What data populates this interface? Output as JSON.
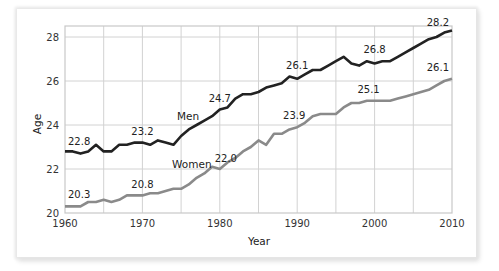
{
  "chart_data": {
    "type": "line",
    "title": "",
    "xlabel": "Year",
    "ylabel": "Age",
    "xlim": [
      1960,
      2010
    ],
    "ylim": [
      20,
      28.6
    ],
    "x_ticks": [
      1960,
      1970,
      1980,
      1990,
      2000,
      2010
    ],
    "x_tick_labels": [
      "1960",
      "1970",
      "1980",
      "1990",
      "2000",
      "2010"
    ],
    "y_ticks": [
      20,
      22,
      24,
      26,
      28
    ],
    "y_tick_labels": [
      "20",
      "22",
      "24",
      "26",
      "28"
    ],
    "grid": {
      "vertical_every_years": 5,
      "horizontal_every": 2
    },
    "legend": "inline labels",
    "x": [
      1960,
      1961,
      1962,
      1963,
      1964,
      1965,
      1966,
      1967,
      1968,
      1969,
      1970,
      1971,
      1972,
      1973,
      1974,
      1975,
      1976,
      1977,
      1978,
      1979,
      1980,
      1981,
      1982,
      1983,
      1984,
      1985,
      1986,
      1987,
      1988,
      1989,
      1990,
      1991,
      1992,
      1993,
      1994,
      1995,
      1996,
      1997,
      1998,
      1999,
      2000,
      2001,
      2002,
      2003,
      2004,
      2005,
      2006,
      2007,
      2008,
      2009,
      2010
    ],
    "series": [
      {
        "name": "Men",
        "color": "#222222",
        "values": [
          22.8,
          22.8,
          22.7,
          22.8,
          23.1,
          22.8,
          22.8,
          23.1,
          23.1,
          23.2,
          23.2,
          23.1,
          23.3,
          23.2,
          23.1,
          23.5,
          23.8,
          24.0,
          24.2,
          24.4,
          24.7,
          24.8,
          25.2,
          25.4,
          25.4,
          25.5,
          25.7,
          25.8,
          25.9,
          26.2,
          26.1,
          26.3,
          26.5,
          26.5,
          26.7,
          26.9,
          27.1,
          26.8,
          26.7,
          26.9,
          26.8,
          26.9,
          26.9,
          27.1,
          27.3,
          27.5,
          27.7,
          27.9,
          28.0,
          28.2,
          28.3
        ]
      },
      {
        "name": "Women",
        "color": "#8a8a8a",
        "values": [
          20.3,
          20.3,
          20.3,
          20.5,
          20.5,
          20.6,
          20.5,
          20.6,
          20.8,
          20.8,
          20.8,
          20.9,
          20.9,
          21.0,
          21.1,
          21.1,
          21.3,
          21.6,
          21.8,
          22.1,
          22.0,
          22.3,
          22.5,
          22.8,
          23.0,
          23.3,
          23.1,
          23.6,
          23.6,
          23.8,
          23.9,
          24.1,
          24.4,
          24.5,
          24.5,
          24.5,
          24.8,
          25.0,
          25.0,
          25.1,
          25.1,
          25.1,
          25.1,
          25.2,
          25.3,
          25.4,
          25.5,
          25.6,
          25.8,
          26.0,
          26.1
        ]
      }
    ],
    "annotations": [
      {
        "series": "Men",
        "year": 1960,
        "label": "22.8"
      },
      {
        "series": "Men",
        "year": 1970,
        "label": "23.2"
      },
      {
        "series": "Men",
        "year": 1980,
        "label": "24.7"
      },
      {
        "series": "Men",
        "year": 1990,
        "label": "26.1"
      },
      {
        "series": "Men",
        "year": 2000,
        "label": "26.8"
      },
      {
        "series": "Men",
        "year": 2010,
        "label": "28.2"
      },
      {
        "series": "Women",
        "year": 1960,
        "label": "20.3"
      },
      {
        "series": "Women",
        "year": 1970,
        "label": "20.8"
      },
      {
        "series": "Women",
        "year": 1980,
        "label": "22.0"
      },
      {
        "series": "Women",
        "year": 1990,
        "label": "23.9"
      },
      {
        "series": "Women",
        "year": 2000,
        "label": "25.1"
      },
      {
        "series": "Women",
        "year": 2010,
        "label": "26.1"
      }
    ]
  },
  "labels": {
    "men": "Men",
    "women": "Women",
    "xlabel": "Year",
    "ylabel": "Age"
  }
}
